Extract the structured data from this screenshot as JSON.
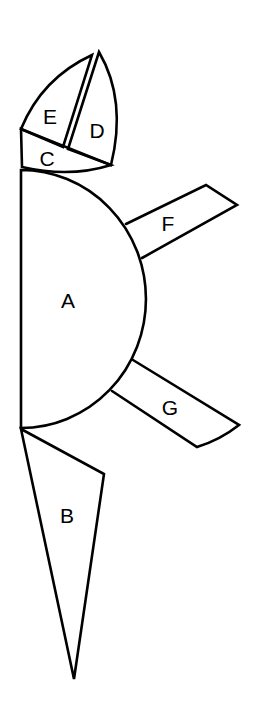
{
  "diagram": {
    "title": "",
    "pieces": [
      {
        "id": "A",
        "label": "A",
        "shape": "semicircle"
      },
      {
        "id": "B",
        "label": "B",
        "shape": "triangle"
      },
      {
        "id": "C",
        "label": "C",
        "shape": "quadrilateral"
      },
      {
        "id": "D",
        "label": "D",
        "shape": "curved-triangle"
      },
      {
        "id": "E",
        "label": "E",
        "shape": "curved-triangle"
      },
      {
        "id": "F",
        "label": "F",
        "shape": "quadrilateral"
      },
      {
        "id": "G",
        "label": "G",
        "shape": "quadrilateral"
      }
    ],
    "colors": {
      "stroke": "#000000",
      "background": "#ffffff"
    }
  }
}
